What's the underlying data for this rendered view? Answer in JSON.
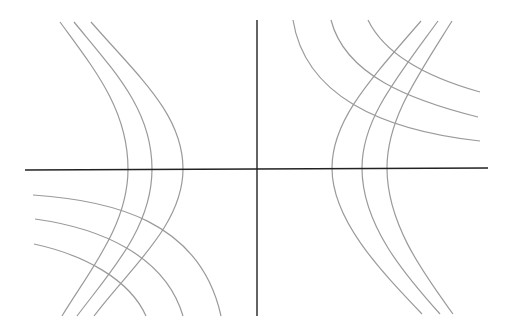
{
  "diagram": {
    "title": "",
    "colors": {
      "background": "#ffffff",
      "axis": "#222222",
      "curve": "#9a9a9a"
    },
    "axes": {
      "x_axis": {
        "x1": 25,
        "y1": 170,
        "x2": 488,
        "y2": 168
      },
      "y_axis": {
        "x1": 257,
        "y1": 20,
        "x2": 257,
        "y2": 316
      }
    },
    "curves": [
      {
        "id": "left-hyperbola-1",
        "d": "M60,22 C95,70 128,110 128,169 C128,225 90,270 62,316"
      },
      {
        "id": "left-hyperbola-2",
        "d": "M74,22 C115,72 152,110 152,169 C152,228 110,272 77,316"
      },
      {
        "id": "left-hyperbola-3",
        "d": "M91,22 C140,78 183,115 183,169 C183,225 130,268 94,316"
      },
      {
        "id": "lower-left-arc-1",
        "d": "M33,195 C110,200 200,220 221,316"
      },
      {
        "id": "lower-left-arc-2",
        "d": "M35,219 C100,228 165,255 183,316"
      },
      {
        "id": "lower-left-arc-3",
        "d": "M34,244 C85,255 130,280 146,316"
      },
      {
        "id": "right-hyperbola-1",
        "d": "M421,21 C370,80 332,120 332,168 C332,220 380,270 422,314"
      },
      {
        "id": "right-hyperbola-2",
        "d": "M438,21 C395,80 362,120 362,168 C362,225 405,275 440,314"
      },
      {
        "id": "right-hyperbola-3",
        "d": "M452,21 C415,80 387,120 387,168 C387,225 425,275 453,314"
      },
      {
        "id": "upper-right-arc-1",
        "d": "M293,20 C305,95 380,130 480,141"
      },
      {
        "id": "upper-right-arc-2",
        "d": "M331,20 C345,75 410,100 478,117"
      },
      {
        "id": "upper-right-arc-3",
        "d": "M368,20 C385,55 430,78 480,92"
      }
    ]
  }
}
